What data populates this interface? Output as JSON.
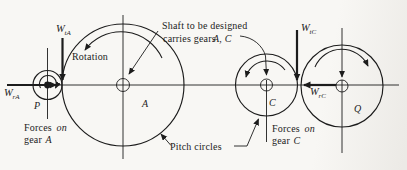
{
  "colors": {
    "ink": "#1c1c1c",
    "paper": "#f8f7f4"
  },
  "annotations": {
    "shaft_note": {
      "line1": "Shaft to be designed",
      "line2_prefix": "carries gears",
      "line2_gears": "A, C"
    },
    "rotation": "Rotation",
    "pitch_circles": "Pitch circles",
    "forces_on_gear_a": {
      "word1": "Forces",
      "word2": "on",
      "word3": "gear",
      "word4": "A"
    },
    "forces_on_gear_c": {
      "word1": "Forces",
      "word2": "on",
      "word3": "gear",
      "word4": "C"
    }
  },
  "gears": {
    "p": {
      "label": "P"
    },
    "a": {
      "label": "A"
    },
    "c": {
      "label": "C"
    },
    "q": {
      "label": "Q"
    }
  },
  "forces": {
    "wta": {
      "symbol": "W",
      "subscript": "tA"
    },
    "wra": {
      "symbol": "W",
      "subscript": "rA"
    },
    "wtc": {
      "symbol": "W",
      "subscript": "tC"
    },
    "wrc": {
      "symbol": "W",
      "subscript": "rC"
    }
  }
}
